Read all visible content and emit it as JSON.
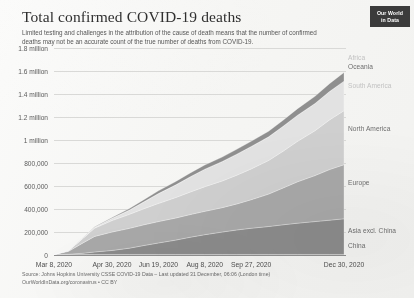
{
  "header": {
    "title": "Total confirmed COVID-19 deaths",
    "subtitle": "Limited testing and challenges in the attribution of the cause of death means that the number of confirmed deaths may not be an accurate count of the true number of deaths from COVID-19.",
    "logo_line1": "Our World",
    "logo_line2": "in Data"
  },
  "footer": {
    "source": "Source: Johns Hopkins University CSSE COVID-19 Data – Last updated 31 December, 06:06 (London time)",
    "license": "OurWorldInData.org/coronavirus • CC BY"
  },
  "chart_data": {
    "type": "area",
    "stacked": true,
    "title": "Total confirmed COVID-19 deaths",
    "xlabel": "",
    "ylabel": "",
    "ylim": [
      0,
      1800000
    ],
    "ytick_labels": [
      "0",
      "200,000",
      "400,000",
      "600,000",
      "800,000",
      "1 million",
      "1.2 million",
      "1.4 million",
      "1.6 million",
      "1.8 million"
    ],
    "ytick_values": [
      0,
      200000,
      400000,
      600000,
      800000,
      1000000,
      1200000,
      1400000,
      1600000,
      1800000
    ],
    "xtick_labels": [
      "Mar 8, 2020",
      "Apr 30, 2020",
      "Jun 19, 2020",
      "Aug 8, 2020",
      "Sep 27, 2020",
      "Dec 30, 2020"
    ],
    "xtick_positions": [
      0,
      0.2,
      0.36,
      0.52,
      0.68,
      1.0
    ],
    "grid": true,
    "legend_position": "right-inline",
    "x": [
      0,
      0.05,
      0.1,
      0.14,
      0.2,
      0.26,
      0.31,
      0.36,
      0.42,
      0.47,
      0.52,
      0.58,
      0.63,
      0.68,
      0.74,
      0.79,
      0.84,
      0.9,
      0.95,
      1.0
    ],
    "series": [
      {
        "name": "China",
        "color": "#9a9a9a",
        "values": [
          3100,
          3300,
          3340,
          4630,
          4640,
          4640,
          4640,
          4640,
          4640,
          4640,
          4640,
          4710,
          4740,
          4740,
          4750,
          4760,
          4770,
          4780,
          4790,
          4800
        ]
      },
      {
        "name": "Asia excl. China",
        "color": "#8b8b8b",
        "values": [
          500,
          3500,
          12000,
          22000,
          35000,
          55000,
          78000,
          100000,
          125000,
          150000,
          172000,
          195000,
          213000,
          228000,
          243000,
          258000,
          272000,
          286000,
          298000,
          310000
        ]
      },
      {
        "name": "Europe",
        "color": "#a8a8a8",
        "values": [
          500,
          25000,
          90000,
          135000,
          160000,
          172000,
          180000,
          186000,
          192000,
          197000,
          203000,
          212000,
          226000,
          248000,
          282000,
          320000,
          360000,
          400000,
          440000,
          470000
        ]
      },
      {
        "name": "North America",
        "color": "#cfcfcf",
        "values": [
          100,
          6000,
          40000,
          72000,
          100000,
          122000,
          140000,
          158000,
          178000,
          196000,
          214000,
          232000,
          250000,
          268000,
          292000,
          320000,
          352000,
          390000,
          432000,
          470000
        ]
      },
      {
        "name": "South America",
        "color": "#e2e2e2",
        "values": [
          0,
          200,
          2500,
          8000,
          20000,
          38000,
          60000,
          85000,
          110000,
          132000,
          152000,
          168000,
          182000,
          194000,
          205000,
          216000,
          226000,
          236000,
          246000,
          256000
        ]
      },
      {
        "name": "Oceania",
        "color": "#bdbdbd",
        "values": [
          0,
          50,
          95,
          100,
          102,
          105,
          112,
          140,
          400,
          700,
          860,
          900,
          907,
          910,
          912,
          915,
          918,
          920,
          925,
          930
        ]
      },
      {
        "name": "Africa",
        "color": "#8f8f8f",
        "values": [
          0,
          100,
          1200,
          3200,
          7000,
          12000,
          18000,
          24000,
          29000,
          33000,
          36000,
          39000,
          42000,
          45000,
          48000,
          52000,
          57000,
          62000,
          68000,
          75000
        ]
      }
    ],
    "legend_labels": [
      {
        "name": "Africa",
        "y_frac": 0.045
      },
      {
        "name": "Oceania",
        "y_frac": 0.085
      },
      {
        "name": "South America",
        "y_frac": 0.18
      },
      {
        "name": "North America",
        "y_frac": 0.385
      },
      {
        "name": "Europe",
        "y_frac": 0.645
      },
      {
        "name": "Asia excl. China",
        "y_frac": 0.88
      },
      {
        "name": "China",
        "y_frac": 0.952
      }
    ]
  }
}
